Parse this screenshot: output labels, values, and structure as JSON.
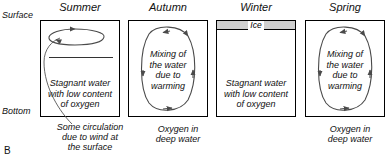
{
  "figure": {
    "letter": "B",
    "axis_labels": {
      "surface": "Surface",
      "bottom": "Bottom"
    }
  },
  "panels": [
    {
      "id": "summer",
      "title": "Summer",
      "inner_text": "Stagnant water\nwith low content\nof oxygen",
      "inner_text_lines": [
        "Stagnant water",
        "with low content",
        "of oxygen"
      ],
      "caption_lines": [
        "Some circulation",
        "due to wind at",
        "the surface"
      ],
      "has_ice": false,
      "ice_label": "",
      "circulation": "shallow-surface-eddy",
      "has_thermocline": true
    },
    {
      "id": "autumn",
      "title": "Autumn",
      "inner_text": "Mixing of\nthe water\ndue to\nwarming",
      "inner_text_lines": [
        "Mixing of",
        "the water",
        "due to",
        "warming"
      ],
      "caption_lines": [
        "Oxygen in",
        "deep water"
      ],
      "has_ice": false,
      "ice_label": "",
      "circulation": "full-depth-loop",
      "has_thermocline": false
    },
    {
      "id": "winter",
      "title": "Winter",
      "inner_text": "Stagnant water\nwith low content\nof oxygen",
      "inner_text_lines": [
        "Stagnant water",
        "with low content",
        "of oxygen"
      ],
      "caption_lines": [],
      "has_ice": true,
      "ice_label": "Ice",
      "circulation": "none",
      "has_thermocline": false
    },
    {
      "id": "spring",
      "title": "Spring",
      "inner_text": "Mixing of\nthe water\ndue to\nwarming",
      "inner_text_lines": [
        "Mixing of",
        "the water",
        "due to",
        "warming"
      ],
      "caption_lines": [
        "Oxygen in",
        "deep water"
      ],
      "has_ice": false,
      "ice_label": "",
      "circulation": "full-depth-loop",
      "has_thermocline": false
    }
  ],
  "colors": {
    "stroke": "#000000",
    "arrow": "#444444",
    "background": "#ffffff",
    "ice_fill": "#cfcfcf"
  }
}
